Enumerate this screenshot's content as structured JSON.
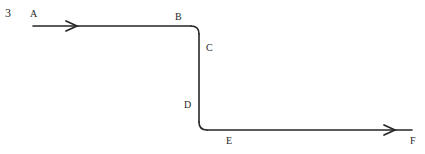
{
  "figure": {
    "number": "3",
    "background_color": "#ffffff",
    "stroke_color": "#262626",
    "label_color": "#262626",
    "width": 425,
    "height": 154
  },
  "labels": [
    {
      "id": "A",
      "text": "A",
      "x": 30,
      "y": 9,
      "anchor": "start-of-upper-pipe"
    },
    {
      "id": "B",
      "text": "B",
      "x": 175,
      "y": 12,
      "anchor": "upper-elbow-top"
    },
    {
      "id": "C",
      "text": "C",
      "x": 206,
      "y": 43,
      "anchor": "vertical-run-upper"
    },
    {
      "id": "D",
      "text": "D",
      "x": 184,
      "y": 100,
      "anchor": "vertical-run-lower"
    },
    {
      "id": "E",
      "text": "E",
      "x": 226,
      "y": 136,
      "anchor": "lower-elbow-right"
    },
    {
      "id": "F",
      "text": "F",
      "x": 410,
      "y": 136,
      "anchor": "end-of-lower-pipe"
    }
  ],
  "geometry": {
    "upper_line": {
      "x_start": 33,
      "x_end": 191,
      "y": 26
    },
    "upper_elbow": {
      "cx": 199,
      "cy": 34,
      "radius": 8,
      "from": "horizontal-right",
      "to": "vertical-down"
    },
    "vertical_line": {
      "x": 199,
      "y_start": 34,
      "y_end": 122
    },
    "lower_elbow": {
      "cx": 207,
      "cy": 122,
      "radius": 8,
      "from": "vertical-down",
      "to": "horizontal-right"
    },
    "lower_line": {
      "x_start": 207,
      "x_end": 412,
      "y": 130
    },
    "stroke_width": 1.6
  },
  "arrows": [
    {
      "id": "upper-flow-arrow",
      "tip_x": 77,
      "y": 26,
      "direction": "right",
      "style": "open-chevron"
    },
    {
      "id": "lower-flow-arrow",
      "tip_x": 395,
      "y": 130,
      "direction": "right",
      "style": "open-chevron"
    }
  ],
  "arrow_style": {
    "half_height": 5,
    "length": 11,
    "stroke_width": 1.7
  }
}
